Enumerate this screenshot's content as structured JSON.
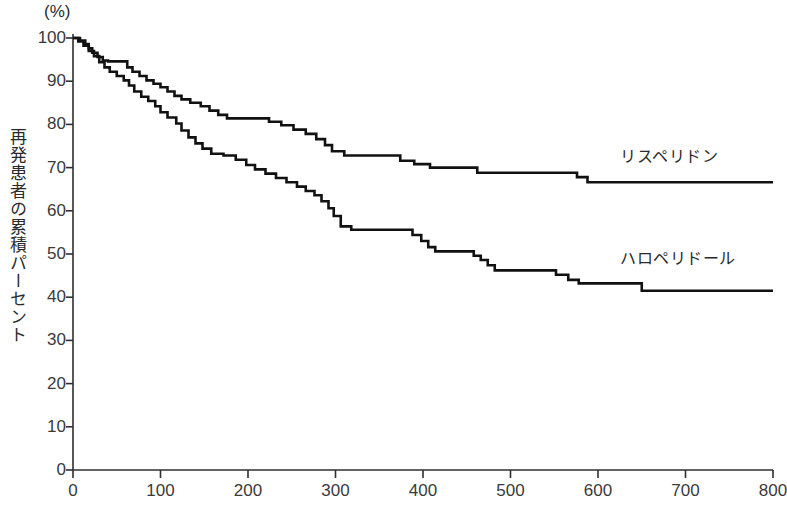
{
  "chart_data": {
    "type": "line",
    "title": "",
    "subtitle": "",
    "xlabel": "",
    "ylabel": "再発患者の累積パーセント",
    "unit_label": "(%)",
    "xlim": [
      0,
      800
    ],
    "ylim": [
      0,
      100
    ],
    "xticks": [
      0,
      100,
      200,
      300,
      400,
      500,
      600,
      700,
      800
    ],
    "yticks": [
      0,
      10,
      20,
      30,
      40,
      50,
      60,
      70,
      80,
      90,
      100
    ],
    "grid": false,
    "legend_position": "right-inline",
    "line_color": "#111111",
    "step": "post",
    "series": [
      {
        "name": "リスペリドン",
        "label_x": 620,
        "label_y": 143,
        "points": [
          [
            0,
            100
          ],
          [
            8,
            99.4
          ],
          [
            14,
            98.6
          ],
          [
            18,
            97.6
          ],
          [
            22,
            96.6
          ],
          [
            28,
            95.6
          ],
          [
            34,
            94.8
          ],
          [
            40,
            94.6
          ],
          [
            58,
            94.6
          ],
          [
            62,
            93.2
          ],
          [
            68,
            92.2
          ],
          [
            76,
            91.2
          ],
          [
            84,
            90.2
          ],
          [
            92,
            89.4
          ],
          [
            100,
            88.6
          ],
          [
            108,
            87.6
          ],
          [
            116,
            86.6
          ],
          [
            124,
            85.8
          ],
          [
            134,
            85.0
          ],
          [
            146,
            84.2
          ],
          [
            156,
            83.2
          ],
          [
            166,
            82.2
          ],
          [
            176,
            81.4
          ],
          [
            212,
            81.4
          ],
          [
            224,
            80.6
          ],
          [
            238,
            79.8
          ],
          [
            252,
            78.8
          ],
          [
            266,
            77.8
          ],
          [
            278,
            76.6
          ],
          [
            288,
            75.2
          ],
          [
            296,
            73.8
          ],
          [
            310,
            72.8
          ],
          [
            366,
            72.8
          ],
          [
            374,
            71.6
          ],
          [
            390,
            70.8
          ],
          [
            408,
            70.0
          ],
          [
            452,
            70.0
          ],
          [
            462,
            68.8
          ],
          [
            520,
            68.8
          ],
          [
            566,
            68.8
          ],
          [
            576,
            67.8
          ],
          [
            588,
            66.6
          ],
          [
            800,
            66.6
          ]
        ]
      },
      {
        "name": "ハロペリドール",
        "label_x": 620,
        "label_y": 245,
        "points": [
          [
            0,
            100
          ],
          [
            6,
            99.2
          ],
          [
            12,
            98.2
          ],
          [
            18,
            97.0
          ],
          [
            24,
            95.8
          ],
          [
            30,
            94.4
          ],
          [
            36,
            93.2
          ],
          [
            42,
            92.2
          ],
          [
            50,
            91.2
          ],
          [
            58,
            90.2
          ],
          [
            64,
            89.0
          ],
          [
            70,
            87.6
          ],
          [
            78,
            86.4
          ],
          [
            86,
            85.4
          ],
          [
            94,
            84.2
          ],
          [
            100,
            82.8
          ],
          [
            108,
            81.6
          ],
          [
            118,
            80.2
          ],
          [
            124,
            78.6
          ],
          [
            132,
            77.0
          ],
          [
            140,
            75.6
          ],
          [
            148,
            74.4
          ],
          [
            158,
            73.2
          ],
          [
            172,
            72.8
          ],
          [
            186,
            71.8
          ],
          [
            198,
            70.6
          ],
          [
            208,
            69.6
          ],
          [
            220,
            68.6
          ],
          [
            232,
            67.6
          ],
          [
            244,
            66.6
          ],
          [
            256,
            65.6
          ],
          [
            266,
            64.6
          ],
          [
            276,
            63.6
          ],
          [
            284,
            62.2
          ],
          [
            292,
            60.6
          ],
          [
            298,
            58.8
          ],
          [
            306,
            56.4
          ],
          [
            318,
            55.6
          ],
          [
            380,
            55.6
          ],
          [
            388,
            54.4
          ],
          [
            398,
            53.0
          ],
          [
            406,
            51.6
          ],
          [
            414,
            50.6
          ],
          [
            450,
            50.6
          ],
          [
            458,
            49.6
          ],
          [
            466,
            48.6
          ],
          [
            474,
            47.4
          ],
          [
            482,
            46.2
          ],
          [
            540,
            46.2
          ],
          [
            552,
            45.2
          ],
          [
            566,
            44.0
          ],
          [
            578,
            43.2
          ],
          [
            640,
            43.2
          ],
          [
            650,
            41.5
          ],
          [
            800,
            41.5
          ]
        ]
      }
    ]
  },
  "axes": {
    "y_tick_labels": [
      "100",
      "90",
      "80",
      "70",
      "60",
      "50",
      "40",
      "30",
      "20",
      "10",
      "0"
    ],
    "x_tick_labels": [
      "0",
      "100",
      "200",
      "300",
      "400",
      "500",
      "600",
      "700",
      "800"
    ]
  }
}
